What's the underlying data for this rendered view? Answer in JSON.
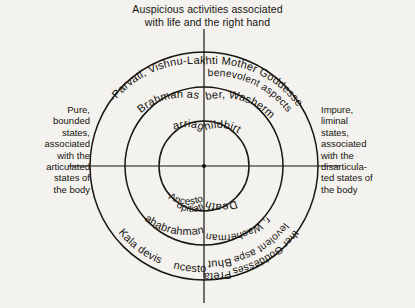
{
  "figure": {
    "type": "concentric-circle-diagram",
    "title_lines": [
      "Auspicious activities associated",
      "with life and the right hand"
    ],
    "center": {
      "x": 204,
      "y": 166
    },
    "radii": {
      "inner": 45,
      "middle": 79,
      "outer": 114,
      "frame": 132
    },
    "axes": [
      "vertical",
      "horizontal"
    ],
    "captions": {
      "left_lines": [
        "Pure,",
        "bounded",
        "states,",
        "associated",
        "with the",
        "articulated",
        "states of",
        "the body"
      ],
      "right_lines": [
        "Impure,",
        "liminal",
        "states,",
        "associated",
        "with the",
        "disarticula-",
        "ted states of",
        "the body"
      ]
    },
    "rings": {
      "inner": {
        "name": "life-cycle-events",
        "segments": [
          {
            "quadrant": "upper-left",
            "label": "Marriage"
          },
          {
            "quadrant": "upper-right",
            "label": "Childbirth"
          },
          {
            "quadrant": "lower-right",
            "label": "Death"
          },
          {
            "quadrant": "lower-left",
            "label": "Ancestor Propitiation"
          }
        ]
      },
      "middle": {
        "name": "ritual-specialists",
        "segments": [
          {
            "quadrant": "upper-left",
            "label": "Pure Brahman as priest"
          },
          {
            "quadrant": "upper-right",
            "label": "Barber, Washerman"
          },
          {
            "quadrant": "lower-right",
            "label": "Barber, Washerman, Dom"
          },
          {
            "quadrant": "lower-left",
            "label": "Mahabrahmans"
          }
        ]
      },
      "outer": {
        "name": "deities-and-spirits",
        "segments": [
          {
            "quadrant": "upper-left",
            "label": "Shiva-Parvati, Vishnu-Lakshmi"
          },
          {
            "quadrant": "upper-right",
            "label": "Sashti Mother Goddesses in benevolent aspects",
            "line1": "Sashti Mother Goddesses in",
            "line2": "benevolent aspects"
          },
          {
            "quadrant": "lower-right",
            "label": "Mother Goddesses in malevolent aspects",
            "line1": "Mother Goddesses in",
            "line2": "malevolent aspects"
          },
          {
            "quadrant": "lower-right-bottom",
            "label": "Preta Bhuta",
            "line1": "Preta",
            "line2": "Bhuta"
          },
          {
            "quadrant": "lower-left",
            "label": "Kala devis"
          },
          {
            "quadrant": "lower-left-bottom",
            "label": "Ancestor"
          }
        ]
      }
    },
    "colors": {
      "ink": "#17150f",
      "paper": "#f4f2ee"
    }
  }
}
